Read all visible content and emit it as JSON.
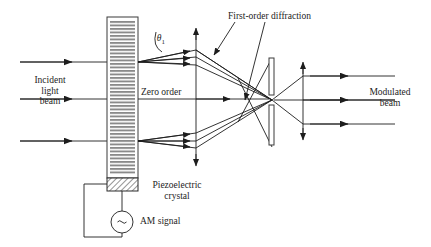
{
  "figure": {
    "type": "optics-diagram",
    "title_visible": false,
    "background_color": "#ffffff",
    "ink_color": "#1d1d1d"
  },
  "labels": {
    "incident_beam": "Incident\nlight\nbeam",
    "theta": "θ",
    "theta_subscript": "1",
    "zero_order": "Zero order",
    "first_order": "First-order diffraction",
    "piezoelectric": "Piezoelectric\ncrystal",
    "am_signal": "AM signal",
    "modulated_beam": "Modulated\nbeam",
    "source_symbol": "∼"
  },
  "components": {
    "grating": {
      "name": "acousto-optic grating",
      "x": 107,
      "y": 17,
      "width": 31,
      "height": 161,
      "stripe_count": 46,
      "stripe_color": "#808080"
    },
    "crystal": {
      "name": "piezoelectric crystal",
      "x": 107,
      "y": 178,
      "width": 31,
      "height": 13,
      "hatch": "diagonal"
    },
    "source": {
      "name": "am signal generator",
      "cx": 122,
      "cy": 222,
      "r": 11
    },
    "slit": {
      "name": "aperture slit",
      "x": 269,
      "width": 5,
      "upper": {
        "y": 58,
        "height": 37
      },
      "lower": {
        "y": 105,
        "height": 40
      }
    },
    "axis_left": {
      "x": 196,
      "y1": 28,
      "y2": 165
    },
    "axis_right": {
      "x": 303,
      "y1": 62,
      "y2": 140
    }
  },
  "rays": {
    "incident_y": [
      62,
      99,
      141
    ],
    "incident_x_start": 20,
    "incident_arrow_x": 70,
    "zero_order_y": 99,
    "zero_order_arrow_x": 228,
    "output_y": [
      76,
      100,
      124
    ],
    "output_x_end": 395
  }
}
